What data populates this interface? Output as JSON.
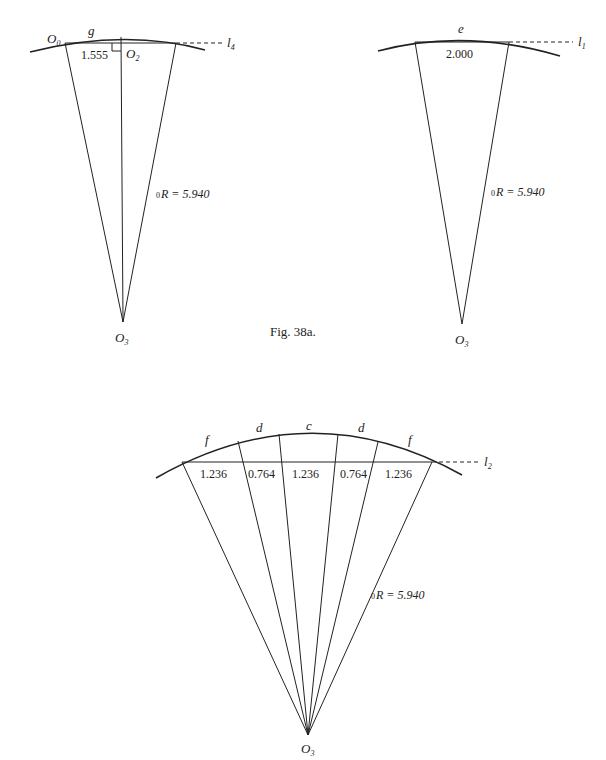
{
  "caption": "Fig. 38a.",
  "diagrams": [
    {
      "id": "top-left",
      "arc_label": "g",
      "left_point_label": "O",
      "left_point_sub": "0",
      "foot_label": "O",
      "foot_sub": "2",
      "half_chord": "1.555",
      "line_label": "l",
      "line_sub": "4",
      "radius_prefix": "0",
      "radius_label": "R = 5.940",
      "apex_label": "O",
      "apex_sub": "3"
    },
    {
      "id": "top-right",
      "arc_label": "e",
      "chord": "2.000",
      "line_label": "l",
      "line_sub": "1",
      "radius_prefix": "0",
      "radius_label": "R = 5.940",
      "apex_label": "O",
      "apex_sub": "3"
    },
    {
      "id": "bottom",
      "arc_labels": [
        "f",
        "d",
        "c",
        "d",
        "f"
      ],
      "segments": [
        "1.236",
        "0.764",
        "1.236",
        "0.764",
        "1.236"
      ],
      "line_label": "l",
      "line_sub": "2",
      "radius_prefix": "0",
      "radius_label": "R = 5.940",
      "apex_label": "O",
      "apex_sub": "3"
    }
  ]
}
